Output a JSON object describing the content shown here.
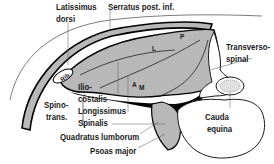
{
  "diagram": {
    "colors": {
      "muscle_fill": "#b8b8b8",
      "fascia": "#000000",
      "background": "#ffffff",
      "outline": "#1a1a1a"
    },
    "labels": {
      "latissimus_dorsi_1": "Latissimus",
      "latissimus_dorsi_2": "dorsi",
      "serratus": "Serratus post. inf.",
      "transversospinal_1": "Transverso-",
      "transversospinal_2": "spinal",
      "rib": "Rib",
      "iliocostalis_1": "Ilio-",
      "iliocostalis_2": "costalis",
      "longissimus": "Longissimus",
      "spinalis": "Spinalis",
      "spinotrans_1": "Spino-",
      "spinotrans_2": "trans.",
      "marker_l": "L",
      "marker_p": "P",
      "marker_a": "A",
      "marker_m": "M",
      "quadratus": "Quadratus lumborum",
      "psoas": "Psoas major",
      "cauda_1": "Cauda",
      "cauda_2": "equina"
    }
  }
}
